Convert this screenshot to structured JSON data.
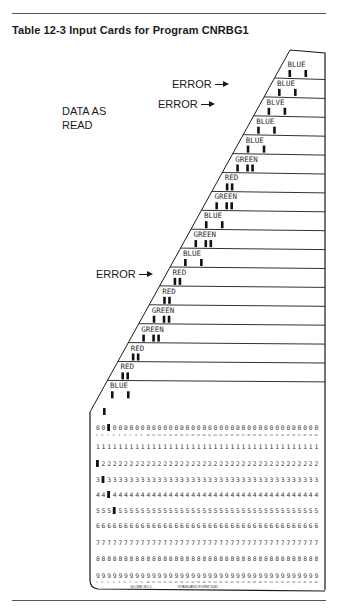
{
  "header": {
    "title": "Table 12-3  Input Cards for Program CNRBG1"
  },
  "side_label": {
    "line1": "DATA AS",
    "line2": "READ"
  },
  "annotations": [
    {
      "label": "ERROR",
      "points_to_card": 3
    },
    {
      "label": "ERROR",
      "points_to_card": 4
    },
    {
      "label": "ERROR",
      "points_to_card": 12
    }
  ],
  "cards": [
    {
      "index": 1,
      "label": "BLUE",
      "error": false
    },
    {
      "index": 2,
      "label": "BLUE",
      "error": false
    },
    {
      "index": 3,
      "label": "BLVE",
      "error": true
    },
    {
      "index": 4,
      "label": "BLUE",
      "error": true
    },
    {
      "index": 5,
      "label": "BLUE",
      "error": false
    },
    {
      "index": 6,
      "label": "GREEN",
      "error": false
    },
    {
      "index": 7,
      "label": "RED",
      "error": false
    },
    {
      "index": 8,
      "label": "GREEN",
      "error": false
    },
    {
      "index": 9,
      "label": "BLUE",
      "error": false
    },
    {
      "index": 10,
      "label": "GREEN",
      "error": false
    },
    {
      "index": 11,
      "label": "BLUE",
      "error": false
    },
    {
      "index": 12,
      "label": "RED",
      "error": true
    },
    {
      "index": 13,
      "label": "RED",
      "error": false
    },
    {
      "index": 14,
      "label": "GREEN",
      "error": false
    },
    {
      "index": 15,
      "label": "GREEN",
      "error": false
    },
    {
      "index": 16,
      "label": "RED",
      "error": false
    },
    {
      "index": 17,
      "label": "RED",
      "error": false
    },
    {
      "index": 18,
      "label": "BLUE",
      "error": false
    }
  ],
  "punch_card": {
    "rows": [
      "0",
      "1",
      "2",
      "3",
      "4",
      "5",
      "6",
      "7",
      "8",
      "9"
    ],
    "columns": 40,
    "footer_left": "GLOBE NO.1",
    "footer_right": "STANDARD FORM 5081"
  }
}
